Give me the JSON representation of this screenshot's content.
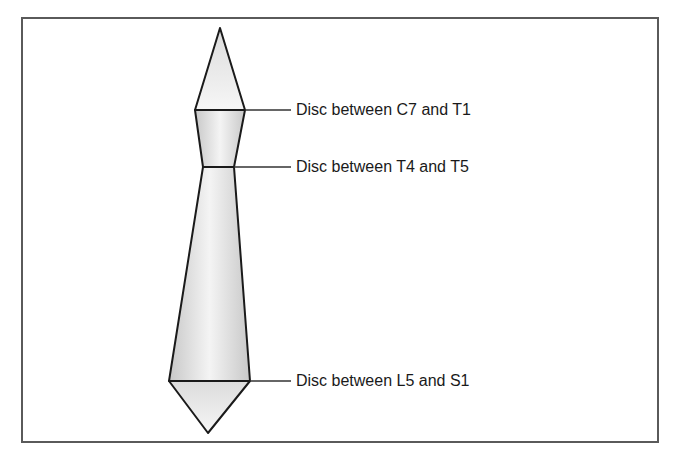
{
  "diagram": {
    "type": "spine-disc-shape",
    "colors": {
      "stroke": "#1a1a1a",
      "fill_light": "#f2f2f2",
      "fill_dark": "#cfcfcf",
      "border": "#5a5a5a",
      "leader": "#333333"
    },
    "labels": [
      {
        "text": "Disc between C7 and T1",
        "y": 110
      },
      {
        "text": "Disc between T4 and T5",
        "y": 167
      },
      {
        "text": "Disc between L5 and S1",
        "y": 381
      }
    ]
  }
}
